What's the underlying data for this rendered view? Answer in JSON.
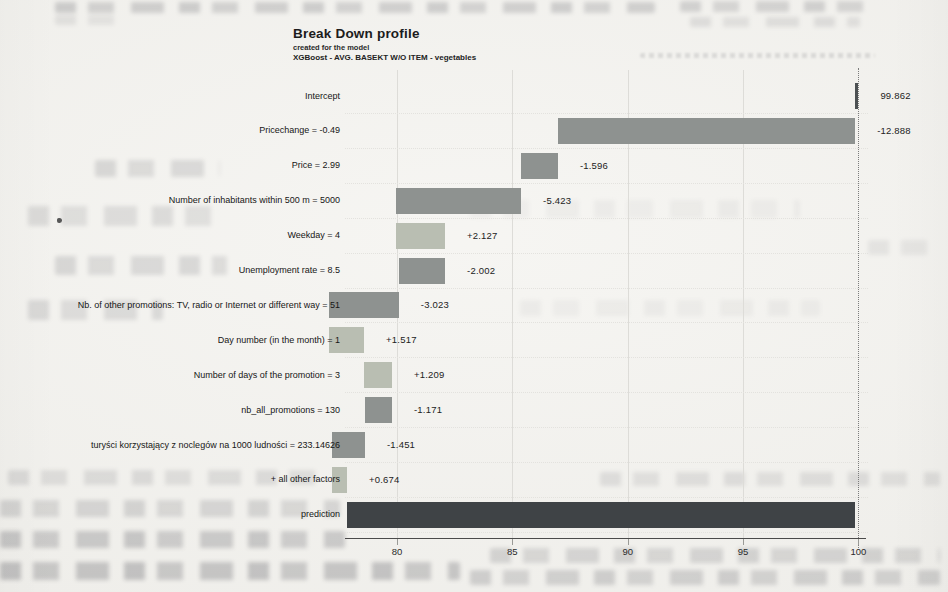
{
  "chart": {
    "title": "Break Down profile",
    "subtitle1": "created for the model",
    "subtitle2": "XGBoost - AVG. BASEKT W/O ITEM - vegetables"
  },
  "chart_data": {
    "type": "bar",
    "subtype": "breakdown-waterfall",
    "orientation": "horizontal",
    "title": "Break Down profile",
    "subtitle": "created for the model | XGBoost - AVG. BASEKT W/O ITEM - vegetables",
    "xlabel": "",
    "ylabel": "",
    "x_axis": {
      "ticks": [
        80,
        85,
        90,
        95,
        100
      ],
      "range": [
        77.5,
        101.5
      ],
      "grid": true
    },
    "intercept_guide_x": 100,
    "rows": [
      {
        "label": "Intercept",
        "contribution": 99.862,
        "value_label": "99.862",
        "start": 99.862,
        "end": 100.0,
        "kind": "intercept"
      },
      {
        "label": "Pricechange = -0.49",
        "contribution": -12.888,
        "value_label": "-12.888",
        "start": 86.974,
        "end": 99.862,
        "kind": "negative"
      },
      {
        "label": "Price = 2.99",
        "contribution": -1.596,
        "value_label": "-1.596",
        "start": 85.378,
        "end": 86.974,
        "kind": "negative"
      },
      {
        "label": "Number of inhabitants within 500 m = 5000",
        "contribution": -5.423,
        "value_label": "-5.423",
        "start": 79.955,
        "end": 85.378,
        "kind": "negative"
      },
      {
        "label": "Weekday = 4",
        "contribution": 2.127,
        "value_label": "+2.127",
        "start": 79.955,
        "end": 82.082,
        "kind": "positive"
      },
      {
        "label": "Unemployment rate = 8.5",
        "contribution": -2.002,
        "value_label": "-2.002",
        "start": 80.08,
        "end": 82.082,
        "kind": "negative"
      },
      {
        "label": "Nb. of other promotions: TV, radio or Internet or different way = 51",
        "contribution": -3.023,
        "value_label": "-3.023",
        "start": 77.057,
        "end": 80.08,
        "kind": "negative"
      },
      {
        "label": "Day number (in the month) = 1",
        "contribution": 1.517,
        "value_label": "+1.517",
        "start": 77.057,
        "end": 78.574,
        "kind": "positive"
      },
      {
        "label": "Number of days of the promotion = 3",
        "contribution": 1.209,
        "value_label": "+1.209",
        "start": 78.574,
        "end": 79.783,
        "kind": "positive"
      },
      {
        "label": "nb_all_promotions = 130",
        "contribution": -1.171,
        "value_label": "-1.171",
        "start": 78.612,
        "end": 79.783,
        "kind": "negative"
      },
      {
        "label": "turyści korzystający z noclegów na 1000 ludności = 233.14626",
        "contribution": -1.451,
        "value_label": "-1.451",
        "start": 77.161,
        "end": 78.612,
        "kind": "negative"
      },
      {
        "label": "+ all other factors",
        "contribution": 0.674,
        "value_label": "+0.674",
        "start": 77.161,
        "end": 77.835,
        "kind": "positive"
      },
      {
        "label": "prediction",
        "contribution": null,
        "value_label": "",
        "start": 77.835,
        "end": 99.862,
        "kind": "prediction"
      }
    ],
    "colors": {
      "positive": "#b9beb2",
      "negative": "#8e9290",
      "prediction": "#3f4346",
      "intercept": "#4c5052"
    }
  }
}
